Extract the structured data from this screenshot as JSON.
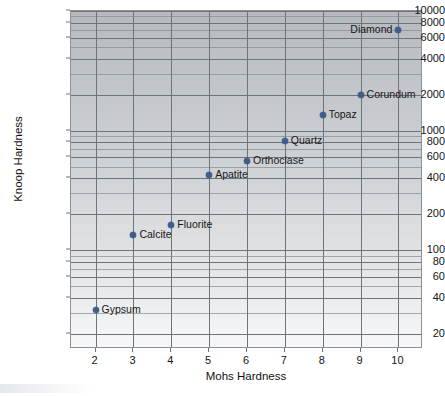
{
  "chart_data": {
    "type": "scatter",
    "title": "",
    "xlabel": "Mohs Hardness",
    "ylabel": "Knoop Hardness",
    "xscale": "linear",
    "yscale": "log",
    "xlim": [
      1.35,
      10.65
    ],
    "ylim": [
      15,
      10000
    ],
    "grid": true,
    "legend": "none",
    "x_ticks": [
      2,
      3,
      4,
      5,
      6,
      7,
      8,
      9,
      10
    ],
    "x_tick_labels": [
      "2",
      "3",
      "4",
      "5",
      "6",
      "7",
      "8",
      "9",
      "10"
    ],
    "y_ticks": [
      20,
      40,
      60,
      80,
      100,
      200,
      400,
      600,
      800,
      1000,
      2000,
      4000,
      6000,
      8000,
      10000
    ],
    "y_tick_labels": [
      "20",
      "40",
      "60",
      "80",
      "100",
      "200",
      "400",
      "600",
      "800",
      "1000",
      "2000",
      "4000",
      "6000",
      "8000",
      "10000"
    ],
    "y_minor_gridlines": [
      30,
      50,
      70,
      90,
      300,
      500,
      700,
      900,
      3000,
      5000,
      7000,
      9000
    ],
    "marker_color": "#3d5d8f",
    "gridline_color": "#6f737a",
    "plot_background_top": "#b6babf",
    "plot_background_bottom": "#f6f7f8",
    "points": [
      {
        "name": "Gypsum",
        "x": 2,
        "y": 32,
        "label_side": "right"
      },
      {
        "name": "Calcite",
        "x": 3,
        "y": 135,
        "label_side": "right"
      },
      {
        "name": "Fluorite",
        "x": 4,
        "y": 163,
        "label_side": "right"
      },
      {
        "name": "Apatite",
        "x": 5,
        "y": 430,
        "label_side": "right"
      },
      {
        "name": "Orthoclase",
        "x": 6,
        "y": 560,
        "label_side": "right"
      },
      {
        "name": "Quartz",
        "x": 7,
        "y": 820,
        "label_side": "right"
      },
      {
        "name": "Topaz",
        "x": 8,
        "y": 1340,
        "label_side": "right"
      },
      {
        "name": "Corundum",
        "x": 9,
        "y": 2000,
        "label_side": "right"
      },
      {
        "name": "Diamond",
        "x": 10,
        "y": 7000,
        "label_side": "left"
      }
    ]
  }
}
